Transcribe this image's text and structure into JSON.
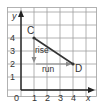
{
  "diagram": {
    "type": "coordinate-grid-slope",
    "axes": {
      "x_label": "x",
      "y_label": "y",
      "origin_label": "0",
      "x_ticks": [
        "1",
        "2",
        "3",
        "4"
      ],
      "y_ticks": [
        "1",
        "2",
        "3",
        "4"
      ]
    },
    "points": [
      {
        "name": "C",
        "x": 1,
        "y": 4
      },
      {
        "name": "D",
        "x": 4,
        "y": 2
      }
    ],
    "annotations": {
      "rise_label": "rise",
      "run_label": "run"
    },
    "colors": {
      "grid": "#9a9a9a",
      "axis": "#222222",
      "segment": "#333333",
      "arrow": "#8a8a8a"
    }
  }
}
